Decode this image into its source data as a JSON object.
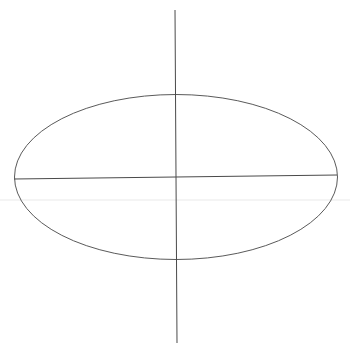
{
  "canvas": {
    "width": 350,
    "height": 355,
    "background": "#ffffff"
  },
  "diagram": {
    "type": "ellipse-with-axes",
    "stroke_color": "#5a5a5a",
    "axis_stroke_color": "#4a4a4a",
    "stroke_width": 1,
    "ellipse": {
      "cx": 176,
      "cy": 177,
      "rx": 161.5,
      "ry": 82.5
    },
    "major_axis": {
      "x1": 14,
      "y1": 179,
      "x2": 337,
      "y2": 175
    },
    "vertical_axis": {
      "x1": 175,
      "y1": 10,
      "x2": 177,
      "y2": 343
    },
    "artifacts": {
      "faint_smudge_y": 200,
      "faint_smudge_color": "#eeeeee"
    }
  }
}
